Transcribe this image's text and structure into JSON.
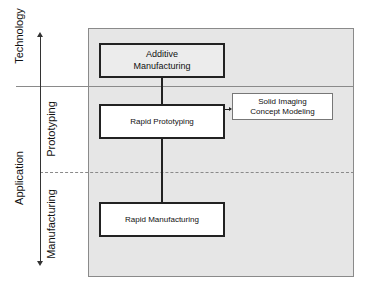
{
  "axis": {
    "top_label": "Technology",
    "bottom_label": "Application",
    "zones": [
      "Prototyping",
      "Manufacturing"
    ]
  },
  "boxes": {
    "additive": "Additive Manufacturing",
    "additive_l1": "Additive",
    "additive_l2": "Manufacturing",
    "rapid_prototyping": "Rapid Prototyping",
    "solid_l1": "Solid Imaging",
    "solid_l2": "Concept Modeling",
    "rapid_manufacturing": "Rapid Manufacturing"
  }
}
